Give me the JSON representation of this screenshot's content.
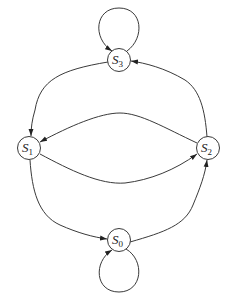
{
  "diagram": {
    "type": "state-transition-graph",
    "nodes": [
      {
        "id": "S3",
        "label": "S",
        "subscript": "3",
        "cx": 119,
        "cy": 60
      },
      {
        "id": "S1",
        "label": "S",
        "subscript": "1",
        "cx": 29,
        "cy": 148
      },
      {
        "id": "S2",
        "label": "S",
        "subscript": "2",
        "cx": 208,
        "cy": 148
      },
      {
        "id": "S0",
        "label": "S",
        "subscript": "0",
        "cx": 119,
        "cy": 240
      }
    ],
    "edges": [
      {
        "from": "S3",
        "to": "S3",
        "kind": "self-loop"
      },
      {
        "from": "S3",
        "to": "S1"
      },
      {
        "from": "S2",
        "to": "S3"
      },
      {
        "from": "S2",
        "to": "S1"
      },
      {
        "from": "S1",
        "to": "S2"
      },
      {
        "from": "S1",
        "to": "S0"
      },
      {
        "from": "S0",
        "to": "S2"
      },
      {
        "from": "S0",
        "to": "S0",
        "kind": "self-loop"
      }
    ],
    "colors": {
      "stroke": "#3a3a3a",
      "background": "#ffffff"
    }
  }
}
